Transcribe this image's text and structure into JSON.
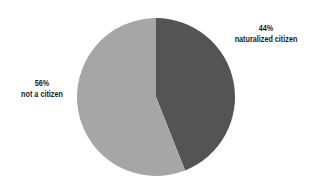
{
  "chart_data": {
    "type": "pie",
    "title": "",
    "categories": [
      "naturalized citizen",
      "not a citizen"
    ],
    "values": [
      44,
      56
    ],
    "labels": [
      "44%",
      "56%"
    ],
    "colors": [
      "#545454",
      "#a6a6a6"
    ],
    "start_angle": "12 o'clock, clockwise",
    "legend": "none (direct labels)"
  },
  "slices": [
    {
      "pct": "44%",
      "name": "naturalized citizen",
      "color": "#545454"
    },
    {
      "pct": "56%",
      "name": "not a citizen",
      "color": "#a6a6a6"
    }
  ]
}
